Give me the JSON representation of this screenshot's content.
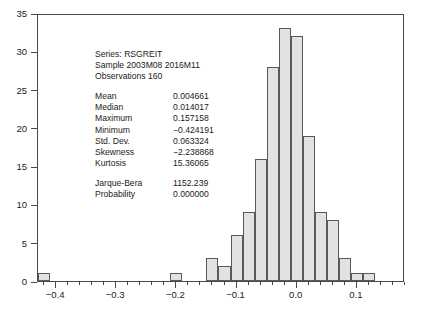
{
  "chart_data": {
    "type": "bar",
    "title": "",
    "xlabel": "",
    "ylabel": "",
    "xlim": [
      -0.43,
      0.18
    ],
    "ylim": [
      0,
      35
    ],
    "grid": false,
    "legend": null,
    "bin_width": 0.02,
    "x_ticks_major": [
      "-0.4",
      "-0.3",
      "-0.2",
      "-0.1",
      "0.0",
      "0.1"
    ],
    "x_tick_values": [
      -0.4,
      -0.3,
      -0.2,
      -0.1,
      0.0,
      0.1
    ],
    "x_minor_step": 0.02,
    "y_ticks": [
      "0",
      "5",
      "10",
      "15",
      "20",
      "25",
      "30",
      "35"
    ],
    "y_tick_values": [
      0,
      5,
      10,
      15,
      20,
      25,
      30,
      35
    ],
    "bin_edges": [
      -0.43,
      -0.41,
      -0.21,
      -0.19,
      -0.15,
      -0.13,
      -0.11,
      -0.09,
      -0.07,
      -0.05,
      -0.03,
      -0.01,
      0.01,
      0.03,
      0.05,
      0.07,
      0.09,
      0.11,
      0.13,
      0.15,
      0.17
    ],
    "bins": [
      {
        "left": -0.43,
        "right": -0.41,
        "count": 1
      },
      {
        "left": -0.21,
        "right": -0.19,
        "count": 1
      },
      {
        "left": -0.15,
        "right": -0.13,
        "count": 3
      },
      {
        "left": -0.13,
        "right": -0.11,
        "count": 2
      },
      {
        "left": -0.11,
        "right": -0.09,
        "count": 6
      },
      {
        "left": -0.09,
        "right": -0.07,
        "count": 9
      },
      {
        "left": -0.07,
        "right": -0.05,
        "count": 16
      },
      {
        "left": -0.05,
        "right": -0.03,
        "count": 28
      },
      {
        "left": -0.03,
        "right": -0.01,
        "count": 33
      },
      {
        "left": -0.01,
        "right": 0.01,
        "count": 32
      },
      {
        "left": 0.01,
        "right": 0.03,
        "count": 19
      },
      {
        "left": 0.03,
        "right": 0.05,
        "count": 9
      },
      {
        "left": 0.05,
        "right": 0.07,
        "count": 8
      },
      {
        "left": 0.07,
        "right": 0.09,
        "count": 3
      },
      {
        "left": 0.09,
        "right": 0.11,
        "count": 1
      },
      {
        "left": 0.11,
        "right": 0.13,
        "count": 1
      }
    ],
    "categories": [
      "-0.42",
      "-0.20",
      "-0.14",
      "-0.12",
      "-0.10",
      "-0.08",
      "-0.06",
      "-0.04",
      "-0.02",
      "0.00",
      "0.02",
      "0.04",
      "0.06",
      "0.08",
      "0.10",
      "0.12"
    ],
    "values": [
      1,
      1,
      3,
      2,
      6,
      9,
      16,
      28,
      33,
      32,
      19,
      9,
      8,
      3,
      1,
      1
    ],
    "bar_fill_color": "#e2e2e2",
    "bar_edge_color": "#595959",
    "frame_color": "#4a4a4a"
  },
  "stats": {
    "header": {
      "series": "Series: RSGREIT",
      "sample": "Sample 2003M08 2016M11",
      "observations": "Observations 160"
    },
    "rows": [
      {
        "key": "Mean",
        "value": "0.004661"
      },
      {
        "key": "Median",
        "value": "0.014017"
      },
      {
        "key": "Maximum",
        "value": "0.157158"
      },
      {
        "key": "Minimum",
        "value": "−0.424191"
      },
      {
        "key": "Std. Dev.",
        "value": "0.063324"
      },
      {
        "key": "Skewness",
        "value": "−2.238868"
      },
      {
        "key": "Kurtosis",
        "value": "15.36065"
      }
    ],
    "tests": [
      {
        "key": "Jarque-Bera",
        "value": "1152.239"
      },
      {
        "key": "Probability",
        "value": "0.000000"
      }
    ]
  }
}
